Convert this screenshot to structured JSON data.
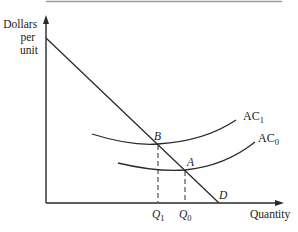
{
  "diagram": {
    "type": "economics-average-cost-demand",
    "y_axis": {
      "label_lines": [
        "Dollars",
        "per",
        "unit"
      ]
    },
    "x_axis": {
      "label": "Quantity"
    },
    "curves": [
      {
        "name": "AC",
        "subscript": "1",
        "label": "AC1"
      },
      {
        "name": "AC",
        "subscript": "0",
        "label": "AC0"
      },
      {
        "name": "D",
        "label": "D"
      }
    ],
    "points": [
      {
        "label": "B",
        "quantity_label": "Q",
        "quantity_subscript": "1"
      },
      {
        "label": "A",
        "quantity_label": "Q",
        "quantity_subscript": "0"
      }
    ],
    "colors": {
      "line": "#2a2a2a",
      "top_rule": "#9a9a9a",
      "background": "#ffffff"
    }
  }
}
